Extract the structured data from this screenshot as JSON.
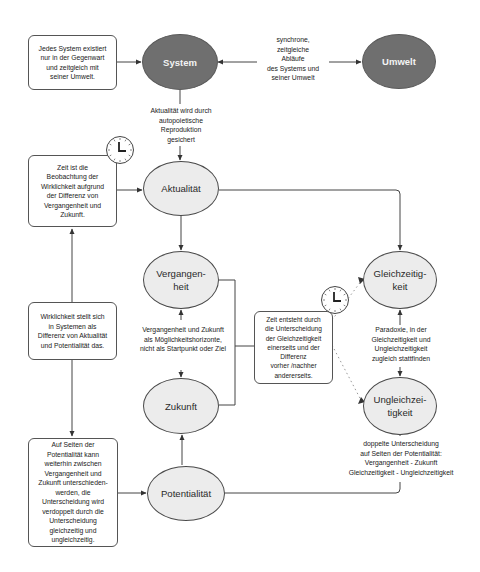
{
  "diagram": {
    "nodes": {
      "system": {
        "label": "System",
        "style": "dark"
      },
      "umwelt": {
        "label": "Umwelt",
        "style": "dark"
      },
      "aktualitaet": {
        "label": "Aktualität",
        "style": "light"
      },
      "vergangenheit": {
        "label": "Vergangen-\nheit",
        "style": "light"
      },
      "zukunft": {
        "label": "Zukunft",
        "style": "light"
      },
      "potentialitaet": {
        "label": "Potentialität",
        "style": "light"
      },
      "gleichzeitigkeit": {
        "label": "Gleichzeitig-\nkeit",
        "style": "light"
      },
      "ungleichzeitigkeit": {
        "label": "Ungleichzei-\ntigkeit",
        "style": "light"
      }
    },
    "boxes": {
      "system_note": "Jedes System existiert\nnur in der Gegenwart\nund zeitgleich mit\nseiner Umwelt.",
      "zeit_note": "Zeit ist die\nBeobachtung der\nWirklichkeit aufgrund\nder Differenz von\nVergangenheit und\nZukunft.",
      "wirklichkeit_note": "Wirklichkeit stellt sich\nin Systemen als\nDifferenz von Aktualität\nund Potentialität das.",
      "potentialitaet_note": "Auf Seiten der\nPotentialität kann\nweiterhin zwischen\nVergangenheit und\nZukunft unterschieden-\nwerden, die\nUnterscheidung wird\nverdoppelt durch die\nUnterscheidung\ngleichzeitig und\nungleichzeitig.",
      "zeit_entsteht_note": "Zeit entsteht durch\ndie Unterscheidung\nder Gleichzeitigkeit\neinerseits und der\nDifferenz\nvorher /nachher\nandererseits."
    },
    "edge_labels": {
      "synchron": "synchrone,\nzeitgleiche\nAbläufe\ndes Systems und\nseiner Umwelt",
      "aktualitaet_gesichert": "Aktualität wird durch\nautopoietische\nReproduktion\ngesichert",
      "horizonte": "Vergangenheit und Zukunft\nals Möglichkeitshorizonte,\nnicht als Startpunkt oder Ziel",
      "paradoxie": "Paradoxie, in der\nGleichzeitigkeit und\nUngleichzeitigkeit\nzugleich stattfinden",
      "doppelte": "doppelte Unterscheidung\nauf Seiten der Potentialität:\nVergangenheit - Zukunft\nGleichzeitigkeit - Ungleichzeitigkeit"
    },
    "icons": [
      "clock-icon",
      "clock-icon"
    ],
    "colors": {
      "dark_node": "#6f6f6f",
      "light_node": "#ececec",
      "line": "#444444"
    }
  }
}
